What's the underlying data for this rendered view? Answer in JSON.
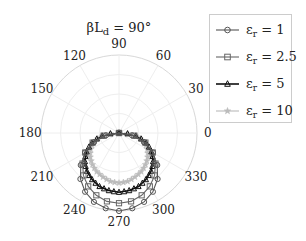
{
  "chart_data": {
    "type": "line",
    "subtype": "polar",
    "title_main": "βL",
    "title_sub": "d",
    "title_rest": " = 90°",
    "angle_ticks": [
      "0",
      "30",
      "60",
      "90",
      "120",
      "150",
      "180",
      "210",
      "240",
      "270",
      "300",
      "330"
    ],
    "angle_tick_values": [
      0,
      30,
      60,
      90,
      120,
      150,
      180,
      210,
      240,
      270,
      300,
      330
    ],
    "rlim": [
      0,
      1
    ],
    "r_grid": [
      0.25,
      0.5,
      0.75,
      1.0
    ],
    "grid": true,
    "legend_position": "right",
    "theta_deg": [
      180,
      190,
      200,
      210,
      220,
      230,
      240,
      250,
      260,
      270,
      280,
      290,
      300,
      310,
      320,
      330,
      340,
      350,
      360
    ],
    "series": [
      {
        "name": "εr = 1",
        "symbol": "ε",
        "subscript": "r",
        "value_label": " = 1",
        "marker": "circle",
        "color": "#555555",
        "values": [
          0.0,
          0.17,
          0.34,
          0.5,
          0.64,
          0.77,
          0.87,
          0.94,
          0.98,
          1.0,
          0.98,
          0.94,
          0.87,
          0.77,
          0.64,
          0.5,
          0.34,
          0.17,
          0.0
        ]
      },
      {
        "name": "εr = 2.5",
        "symbol": "ε",
        "subscript": "r",
        "value_label": " = 2.5",
        "marker": "square",
        "color": "#666666",
        "values": [
          0.0,
          0.2,
          0.36,
          0.5,
          0.61,
          0.71,
          0.79,
          0.85,
          0.89,
          0.9,
          0.89,
          0.85,
          0.79,
          0.71,
          0.61,
          0.5,
          0.36,
          0.2,
          0.0
        ]
      },
      {
        "name": "εr = 5",
        "symbol": "ε",
        "subscript": "r",
        "value_label": " = 5",
        "marker": "triangle",
        "color": "#111111",
        "values": [
          0.0,
          0.22,
          0.37,
          0.48,
          0.57,
          0.64,
          0.69,
          0.73,
          0.75,
          0.76,
          0.75,
          0.73,
          0.69,
          0.64,
          0.57,
          0.48,
          0.37,
          0.22,
          0.0
        ]
      },
      {
        "name": "εr = 10",
        "symbol": "ε",
        "subscript": "r",
        "value_label": " = 10",
        "marker": "star",
        "color": "#bbbbbb",
        "values": [
          0.0,
          0.22,
          0.34,
          0.42,
          0.48,
          0.53,
          0.57,
          0.6,
          0.63,
          0.64,
          0.63,
          0.6,
          0.57,
          0.53,
          0.48,
          0.42,
          0.34,
          0.22,
          0.0
        ]
      }
    ]
  }
}
